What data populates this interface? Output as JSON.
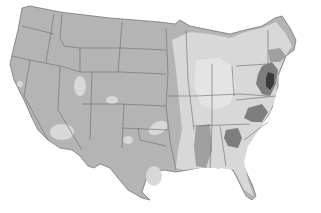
{
  "map": {
    "type": "choropleth",
    "region": "Contiguous United States",
    "style": "grayscale",
    "legend": null,
    "colors": {
      "background": "#ffffff",
      "base_west": "#b4b4b4",
      "light": "#d8d8d8",
      "lighter": "#e4e4e4",
      "medium": "#a0a0a0",
      "dark": "#7e7e7e",
      "darkest": "#3a3a3a",
      "border": "#6a6a6a"
    },
    "shading_levels": [
      "lighter",
      "light",
      "base_west",
      "medium",
      "dark",
      "darkest"
    ],
    "highlighted_areas": [
      {
        "area": "New Jersey / Delaware",
        "level": "darkest"
      },
      {
        "area": "Maryland / Eastern Pennsylvania",
        "level": "dark"
      },
      {
        "area": "Southern New England",
        "level": "medium"
      },
      {
        "area": "Northern Georgia",
        "level": "dark"
      },
      {
        "area": "Western North Carolina / Virginia",
        "level": "dark"
      },
      {
        "area": "Mississippi / Alabama",
        "level": "medium"
      },
      {
        "area": "Great Plains",
        "level": "base_west"
      },
      {
        "area": "Midwest",
        "level": "light"
      },
      {
        "area": "Southeast coastal",
        "level": "light"
      }
    ]
  }
}
